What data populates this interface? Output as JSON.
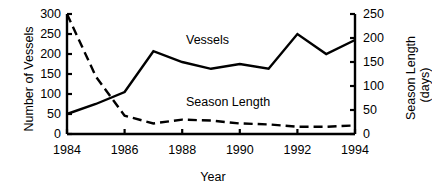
{
  "chart_data": {
    "type": "line",
    "title": "",
    "xlabel": "Year",
    "ylabel": "Number of Vessels",
    "y2label": "Season Length (days)",
    "ylabel_line1": "Season Length",
    "ylabel_line2": "(days)",
    "x": [
      1984,
      1985,
      1986,
      1987,
      1988,
      1989,
      1990,
      1991,
      1992,
      1993,
      1994
    ],
    "xlim": [
      1984,
      1994
    ],
    "ylim": [
      0,
      300
    ],
    "y2lim": [
      0,
      250
    ],
    "xticks": [
      "1984",
      "1986",
      "1988",
      "1990",
      "1992",
      "1994"
    ],
    "xtick_values": [
      1984,
      1986,
      1988,
      1990,
      1992,
      1994
    ],
    "yticks": [
      "0",
      "50",
      "100",
      "150",
      "200",
      "250",
      "300"
    ],
    "ytick_values": [
      0,
      50,
      100,
      150,
      200,
      250,
      300
    ],
    "y2ticks": [
      "0",
      "50",
      "100",
      "150",
      "200",
      "250"
    ],
    "y2tick_values": [
      0,
      50,
      100,
      150,
      200,
      250
    ],
    "grid": false,
    "legend_position": "inline-annotation",
    "series": [
      {
        "name": "Vessels",
        "axis": "left",
        "style": "solid",
        "color": "#000000",
        "values": [
          50,
          75,
          105,
          207,
          180,
          163,
          175,
          163,
          250,
          200,
          235
        ]
      },
      {
        "name": "Season Length",
        "axis": "right",
        "style": "dashed",
        "color": "#000000",
        "values": [
          250,
          120,
          38,
          22,
          30,
          28,
          22,
          20,
          15,
          15,
          18
        ]
      }
    ],
    "annotations": [
      {
        "text": "Vessels",
        "x": 1988.2,
        "y": 245
      },
      {
        "text": "Season Length",
        "x": 1988.2,
        "y": 95
      }
    ]
  }
}
